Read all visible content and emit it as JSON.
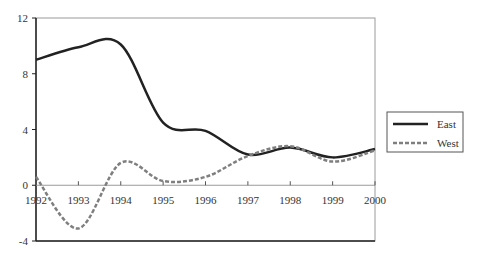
{
  "chart_data": {
    "type": "line",
    "title": "",
    "xlabel": "",
    "ylabel": "",
    "x": [
      1992,
      1993,
      1994,
      1995,
      1996,
      1997,
      1998,
      1999,
      2000
    ],
    "series": [
      {
        "name": "East",
        "values": [
          9.0,
          9.9,
          10.1,
          4.5,
          3.9,
          2.2,
          2.7,
          2.0,
          2.6
        ],
        "color": "#222222",
        "style": "solid"
      },
      {
        "name": "West",
        "values": [
          0.6,
          -3.1,
          1.6,
          0.3,
          0.6,
          2.1,
          2.8,
          1.7,
          2.5
        ],
        "color": "#7f7f7f",
        "style": "dashed"
      }
    ],
    "xlim": [
      1992,
      2000
    ],
    "ylim": [
      -4,
      12
    ],
    "x_ticks": [
      "1992",
      "1993",
      "1994",
      "1995",
      "1996",
      "1997",
      "1998",
      "1999",
      "2000"
    ],
    "y_ticks": [
      "-4",
      "0",
      "4",
      "8",
      "12"
    ],
    "smoothed": true,
    "grid": false,
    "legend_position": "right"
  },
  "legend": {
    "items": [
      {
        "label": "East"
      },
      {
        "label": "West"
      }
    ]
  }
}
